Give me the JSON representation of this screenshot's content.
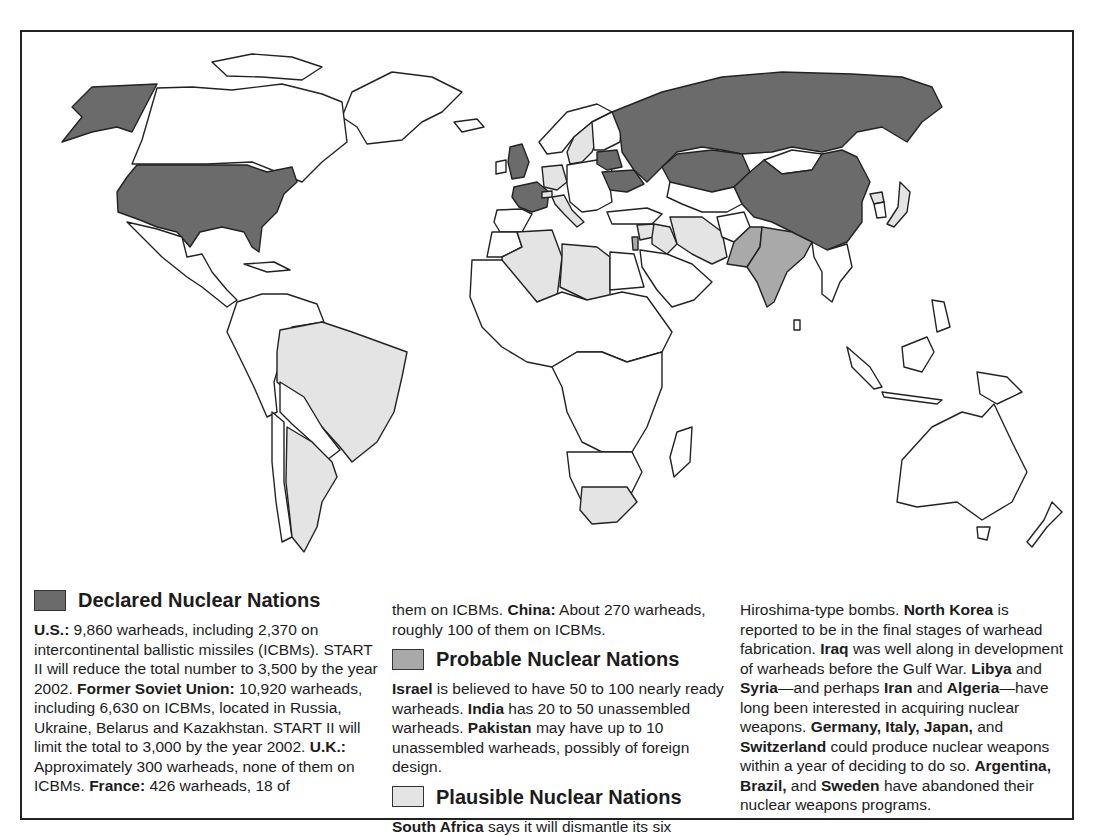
{
  "map": {
    "colors": {
      "declared": "#6b6b6b",
      "probable": "#a9a9a9",
      "plausible": "#e4e4e4",
      "none": "#ffffff",
      "border": "#222222"
    },
    "regions": {
      "declared": [
        "United States",
        "Russia",
        "Ukraine",
        "Belarus",
        "Kazakhstan",
        "United Kingdom",
        "France",
        "China"
      ],
      "probable": [
        "Israel",
        "India",
        "Pakistan"
      ],
      "plausible": [
        "South Africa",
        "North Korea",
        "Iraq",
        "Libya",
        "Syria",
        "Iran",
        "Algeria",
        "Germany",
        "Italy",
        "Japan",
        "Switzerland",
        "Argentina",
        "Brazil",
        "Sweden"
      ]
    }
  },
  "legend": {
    "declared": {
      "title": "Declared Nuclear Nations",
      "segments": [
        {
          "b": "U.S.:",
          "t": " 9,860 warheads, including 2,370 on intercontinental ballistic missiles (ICBMs). START II will reduce the total number to 3,500 by the year 2002. "
        },
        {
          "b": "Former Soviet Union:",
          "t": " 10,920 warheads, including 6,630 on ICBMs, located in Russia, Ukraine, Belarus and Kazakhstan. START II will limit the total to 3,000 by the year 2002. "
        },
        {
          "b": "U.K.:",
          "t": " Approximately 300 warheads, none of them on ICBMs. "
        },
        {
          "b": "France:",
          "t": " 426 warheads, 18 of them on ICBMs. "
        },
        {
          "b": "China:",
          "t": " About 270 warheads, roughly 100 of them on ICBMs."
        }
      ]
    },
    "probable": {
      "title": "Probable Nuclear Nations",
      "segments": [
        {
          "b": "Israel",
          "t": " is believed to have 50 to 100 nearly ready warheads. "
        },
        {
          "b": "India",
          "t": " has 20 to 50 unassembled warheads. "
        },
        {
          "b": "Pakistan",
          "t": " may have up to 10 unassembled warheads, possibly of foreign design."
        }
      ]
    },
    "plausible": {
      "title": "Plausible Nuclear Nations",
      "segments": [
        {
          "b": "South Africa",
          "t": " says it will dismantle its six Hiroshima-type bombs. "
        },
        {
          "b": "North Korea",
          "t": " is reported to be in the final stages of warhead fabrication. "
        },
        {
          "b": "Iraq",
          "t": " was well along in development of warheads before the Gulf War. "
        },
        {
          "b": "Libya",
          "t": " and "
        },
        {
          "b": "Syria",
          "t": "—and perhaps "
        },
        {
          "b": "Iran",
          "t": " and "
        },
        {
          "b": "Algeria",
          "t": "—have long been interested in acquiring nuclear weapons. "
        },
        {
          "b": "Germany, Italy, Japan,",
          "t": " and "
        },
        {
          "b": "Switzerland",
          "t": " could produce nuclear weapons within a year of deciding to do so. "
        },
        {
          "b": "Argentina, Brazil,",
          "t": " and "
        },
        {
          "b": "Sweden",
          "t": " have abandoned their nuclear weapons programs."
        }
      ]
    }
  },
  "text": {
    "col1": {
      "us_b": "U.S.:",
      "us_t": " 9,860 warheads, including 2,370 on intercontinental ballistic missiles (ICBMs). START II will reduce the total number to 3,500 by the year 2002. ",
      "fsu_b": "Former Soviet Union:",
      "fsu_t": " 10,920 warheads, including 6,630 on ICBMs, located in Russia, Ukraine, Belarus and Kazakhstan. START II will limit the total to 3,000 by the year 2002. ",
      "uk_b": "U.K.:",
      "uk_t": " Approximately 300 warheads, none of them on ICBMs. ",
      "fr_b": "France:",
      "fr_t": " 426 warheads, 18 of"
    },
    "col2": {
      "cont_t": "them on ICBMs. ",
      "china_b": "China:",
      "china_t": " About 270 warheads, roughly 100 of them on ICBMs.",
      "israel_b": "Israel",
      "israel_t": " is believed to have 50 to 100 nearly ready warheads. ",
      "india_b": "India",
      "india_t": " has 20 to 50 unassembled warheads. ",
      "pak_b": "Pakistan",
      "pak_t": " may have up to 10 unassembled warheads, possibly of foreign design.",
      "sa_b": "South Africa",
      "sa_t": " says it will dismantle its six"
    },
    "col3": {
      "p1_t": "Hiroshima-type bombs. ",
      "nk_b": "North Korea",
      "nk_t": " is reported to be in the final stages of warhead fabrication. ",
      "iraq_b": "Iraq",
      "iraq_t": " was well along in development of warheads before the Gulf War. ",
      "libya_b": "Libya",
      "and1": " and ",
      "syria_b": "Syria",
      "perhaps": "—and perhaps ",
      "iran_b": "Iran",
      "and2": " and ",
      "alg_b": "Algeria",
      "alg_t": "—have long been interested in acquiring nuclear weapons. ",
      "gij_b": "Germany, Italy, Japan,",
      "and3": " and ",
      "swiss_b": "Switzerland",
      "swiss_t": " could produce nuclear weapons within a year of deciding to do so. ",
      "ab_b": "Argentina, Brazil,",
      "and4": " and ",
      "swe_b": "Sweden",
      "swe_t": " have abandoned their nuclear weapons programs."
    }
  }
}
